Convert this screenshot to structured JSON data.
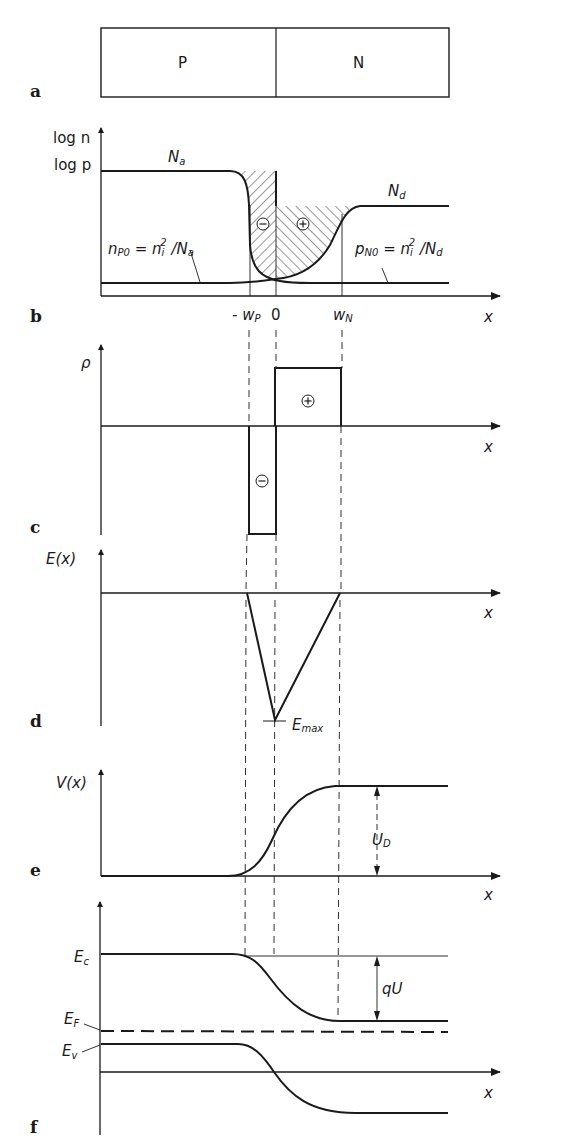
{
  "figure": {
    "panels": {
      "a": {
        "label": "a",
        "regions": [
          "P",
          "N"
        ]
      },
      "b": {
        "label": "b",
        "y_axis": [
          "log n",
          "log p"
        ],
        "x_axis": "x",
        "levels": {
          "acceptor": "Na",
          "donor": "Nd"
        },
        "minority_p": "nP0 = ni² / Na",
        "minority_n": "pN0 = ni² / Nd",
        "ticks": [
          "-wP",
          "0",
          "wN"
        ],
        "charge_symbols": [
          "⊖",
          "⊕"
        ]
      },
      "c": {
        "label": "c",
        "y_axis": "ρ",
        "x_axis": "x",
        "charge_symbols": [
          "⊕",
          "⊖"
        ]
      },
      "d": {
        "label": "d",
        "y_axis": "E(x)",
        "x_axis": "x",
        "annotation": "Emax"
      },
      "e": {
        "label": "e",
        "y_axis": "V(x)",
        "x_axis": "x",
        "annotation": "UD"
      },
      "f": {
        "label": "f",
        "x_axis": "x",
        "bands": [
          "Ec",
          "EF",
          "Ev"
        ],
        "annotation": "qU"
      }
    }
  },
  "text": {
    "a_label": "a",
    "b_label": "b",
    "c_label": "c",
    "d_label": "d",
    "e_label": "e",
    "f_label": "f",
    "region_p": "P",
    "region_n": "N",
    "log_n": "log n",
    "log_p": "log p",
    "N": "N",
    "a_sub": "a",
    "d_sub": "d",
    "n": "n",
    "p": "p",
    "P0": "P0",
    "N0": "N0",
    "eq": " = ",
    "ni": "n",
    "i_sub": "i",
    "sq": "2",
    "slash": " /",
    "minus_wp": "- w",
    "wp_sub": "P",
    "zero": "0",
    "wn": "w",
    "wn_sub": "N",
    "x": "x",
    "rho": "ρ",
    "Ex": "E(x)",
    "E": "E",
    "max_sub": "max",
    "Vx": "V(x)",
    "U": "U",
    "D_sub": "D",
    "qU": "qU",
    "c_sub": "c",
    "F_sub": "F",
    "v_sub": "v",
    "minus_sym": "−",
    "plus_sym": "+"
  }
}
